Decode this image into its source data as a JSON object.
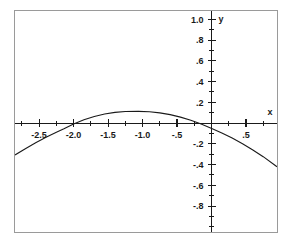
{
  "chart_data": {
    "type": "line",
    "title": "",
    "subtitle": "",
    "xlabel": "x",
    "ylabel": "y",
    "grid": false,
    "legend": null,
    "xlim": [
      -2.85,
      0.95
    ],
    "ylim": [
      -1.05,
      1.08
    ],
    "x_ticks": [
      -2.5,
      -2.0,
      -1.5,
      -1.0,
      -0.5,
      0.5
    ],
    "x_tick_labels": [
      "-2.5",
      "-2.0",
      "-1.5",
      "-1.0",
      "-.5",
      ".5"
    ],
    "x_minor_tick_step": 0.25,
    "y_ticks": [
      1.0,
      0.8,
      0.6,
      0.4,
      0.2,
      -0.2,
      -0.4,
      -0.6,
      -0.8
    ],
    "y_tick_labels": [
      "1.0",
      ".8",
      ".6",
      ".4",
      ".2",
      "-.2",
      "-.4",
      "-.6",
      "-.8"
    ],
    "y_minor_tick_step": 0.1,
    "axis_origin": [
      0,
      0
    ],
    "series": [
      {
        "name": "curve",
        "color": "#1a1a1a",
        "description": "downward-opening parabola",
        "vertex": [
          -1.06,
          0.113
        ],
        "roots": [
          -2.14,
          0.02
        ],
        "x": [
          -2.85,
          -2.7,
          -2.55,
          -2.4,
          -2.25,
          -2.14,
          -2.0,
          -1.85,
          -1.7,
          -1.55,
          -1.4,
          -1.25,
          -1.06,
          -0.9,
          -0.75,
          -0.6,
          -0.45,
          -0.3,
          -0.15,
          0.02,
          0.15,
          0.3,
          0.45,
          0.6,
          0.75,
          0.95
        ],
        "y": [
          -0.308,
          -0.247,
          -0.19,
          -0.137,
          -0.088,
          -0.055,
          -0.008,
          0.031,
          0.063,
          0.087,
          0.103,
          0.112,
          0.113,
          0.109,
          0.098,
          0.081,
          0.057,
          0.027,
          -0.01,
          -0.057,
          -0.095,
          -0.144,
          -0.199,
          -0.259,
          -0.324,
          -0.421
        ]
      }
    ]
  },
  "frame": {
    "border_color": "#9a9a9a",
    "background_color": "#ffffff"
  }
}
